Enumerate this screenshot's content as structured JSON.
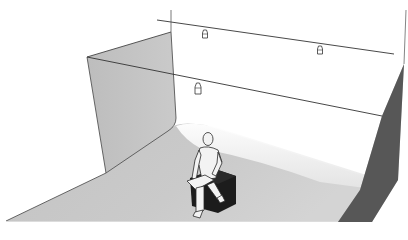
{
  "scene": {
    "title": "Photo studio cyclorama with seated figure",
    "colors": {
      "background": "#ffffff",
      "wall_left": "#c4c4c4",
      "floor": "#c6c6c6",
      "floor_lit": "#e9e9e9",
      "wall_right": "#5a5a5a",
      "line": "#3a3a3a",
      "cube": "#1e1e1e",
      "figure": "#f2f2f2"
    },
    "objects": [
      {
        "name": "left-wall",
        "label": "Cyclorama wall"
      },
      {
        "name": "floor",
        "label": "Studio floor"
      },
      {
        "name": "right-wall",
        "label": "Side wall"
      },
      {
        "name": "light-rail-back",
        "label": "Back light rail"
      },
      {
        "name": "light-rail-front",
        "label": "Front light rail"
      },
      {
        "name": "light-1",
        "label": "Ceiling light"
      },
      {
        "name": "light-2",
        "label": "Ceiling light"
      },
      {
        "name": "light-3",
        "label": "Ceiling light"
      },
      {
        "name": "seat-cube",
        "label": "Seat cube"
      },
      {
        "name": "seated-figure",
        "label": "Seated person"
      }
    ]
  }
}
